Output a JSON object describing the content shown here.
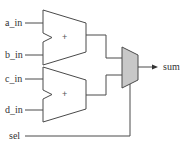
{
  "diagram": {
    "type": "circuit-schematic",
    "inputs": [
      {
        "id": "a_in",
        "label": "a_in"
      },
      {
        "id": "b_in",
        "label": "b_in"
      },
      {
        "id": "c_in",
        "label": "c_in"
      },
      {
        "id": "d_in",
        "label": "d_in"
      },
      {
        "id": "sel",
        "label": "sel"
      }
    ],
    "adders": [
      {
        "id": "adder_top",
        "symbol": "+",
        "inputs": [
          "a_in",
          "b_in"
        ]
      },
      {
        "id": "adder_bottom",
        "symbol": "+",
        "inputs": [
          "c_in",
          "d_in"
        ]
      }
    ],
    "mux": {
      "id": "mux",
      "inputs": [
        "adder_top",
        "adder_bottom"
      ],
      "select": "sel",
      "fill": "#c8c8c8"
    },
    "output": {
      "id": "sum",
      "label": "sum"
    }
  }
}
